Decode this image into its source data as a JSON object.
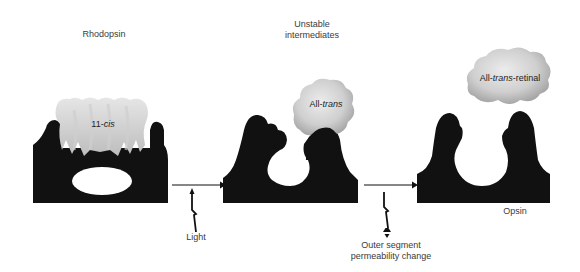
{
  "labels": {
    "rhodopsin": "Rhodopsin",
    "unstable_line1": "Unstable",
    "unstable_line2": "intermediates",
    "opsin": "Opsin",
    "light": "Light",
    "outer_line1": "Outer segment",
    "outer_line2": "permeability change"
  },
  "chromophores": {
    "eleven_cis": {
      "prefix": "11-",
      "italic": "cis",
      "suffix": ""
    },
    "all_trans": {
      "prefix": "All-",
      "italic": "trans",
      "suffix": ""
    },
    "all_trans_retinal": {
      "prefix": "All-",
      "italic": "trans",
      "suffix": "-retinal"
    }
  },
  "colors": {
    "protein": "#111111",
    "cloud_light": "#e2e2e2",
    "cloud_dark": "#a9a9a9",
    "arrow": "#111111"
  }
}
